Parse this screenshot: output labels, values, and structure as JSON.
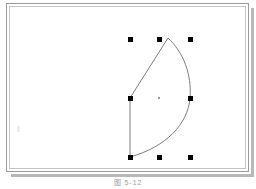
{
  "document": {
    "title": "Selected Shape",
    "background_color": "#ffffff"
  },
  "frame": {
    "name": "slide-frame",
    "border_color": "#9a9a9a",
    "inner_border_color": "#c4c4c4",
    "shadow_color": "#b8b8b8",
    "fill_color": "#ffffff",
    "x": 6,
    "y": 3,
    "width": 243,
    "height": 169
  },
  "shape": {
    "name": "leaf-petal-shape",
    "type": "closed-path",
    "stroke_color": "#6e6e6e",
    "stroke_width": 0.9,
    "fill": "none",
    "path": "M 130 157 L 130 98 L 168 38 C 183 52 192 74 190 98 C 188 124 166 147 130 157 Z",
    "apex": [
      168,
      38
    ],
    "left_top": [
      130,
      98
    ],
    "left_bottom": [
      130,
      157
    ],
    "right_mid": [
      190,
      98
    ],
    "selected": true
  },
  "selection": {
    "name": "selection-handles",
    "handle_color": "#000000",
    "handle_size": 5,
    "center_marker_color": "#9b9b9b",
    "columns_x": [
      130,
      159,
      190
    ],
    "rows_y": [
      39,
      98,
      157
    ],
    "center": [
      159,
      98
    ],
    "handles": [
      {
        "label": "top-left",
        "x": 130,
        "y": 39
      },
      {
        "label": "top-center",
        "x": 159,
        "y": 39
      },
      {
        "label": "top-right",
        "x": 190,
        "y": 39
      },
      {
        "label": "middle-left",
        "x": 130,
        "y": 98
      },
      {
        "label": "middle-right",
        "x": 190,
        "y": 98
      },
      {
        "label": "bottom-left",
        "x": 130,
        "y": 157
      },
      {
        "label": "bottom-center",
        "x": 159,
        "y": 157
      },
      {
        "label": "bottom-right",
        "x": 190,
        "y": 157
      }
    ]
  },
  "caption": {
    "name": "figure-caption",
    "text": "图 5-12",
    "color": "#9d9d9d"
  }
}
